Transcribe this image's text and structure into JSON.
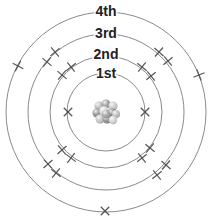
{
  "diagram": {
    "center": [
      106,
      112
    ],
    "shells": [
      {
        "label": "1st",
        "radius": 39,
        "label_y": 74
      },
      {
        "label": "2nd",
        "radius": 56,
        "label_y": 55
      },
      {
        "label": "3rd",
        "radius": 78,
        "label_y": 34
      },
      {
        "label": "4th",
        "radius": 100,
        "label_y": 12
      }
    ],
    "electrons": [
      {
        "shell": "1st",
        "x": 68,
        "y": 112,
        "style": "x"
      },
      {
        "shell": "1st",
        "x": 145,
        "y": 112,
        "style": "x"
      },
      {
        "shell": "2nd",
        "x": 62,
        "y": 75,
        "style": "plus"
      },
      {
        "shell": "2nd",
        "x": 71,
        "y": 67,
        "style": "plus"
      },
      {
        "shell": "2nd",
        "x": 142,
        "y": 67,
        "style": "plus"
      },
      {
        "shell": "2nd",
        "x": 151,
        "y": 76,
        "style": "plus"
      },
      {
        "shell": "2nd",
        "x": 62,
        "y": 150,
        "style": "plus"
      },
      {
        "shell": "2nd",
        "x": 71,
        "y": 158,
        "style": "plus"
      },
      {
        "shell": "2nd",
        "x": 150,
        "y": 148,
        "style": "plus"
      },
      {
        "shell": "2nd",
        "x": 142,
        "y": 158,
        "style": "plus"
      },
      {
        "shell": "3rd",
        "x": 47,
        "y": 62,
        "style": "plus"
      },
      {
        "shell": "3rd",
        "x": 55,
        "y": 52,
        "style": "plus"
      },
      {
        "shell": "3rd",
        "x": 159,
        "y": 52,
        "style": "plus"
      },
      {
        "shell": "3rd",
        "x": 168,
        "y": 61,
        "style": "plus"
      },
      {
        "shell": "3rd",
        "x": 48,
        "y": 164,
        "style": "plus"
      },
      {
        "shell": "3rd",
        "x": 56,
        "y": 173,
        "style": "plus"
      },
      {
        "shell": "3rd",
        "x": 166,
        "y": 165,
        "style": "plus"
      },
      {
        "shell": "3rd",
        "x": 157,
        "y": 175,
        "style": "plus"
      },
      {
        "shell": "4th",
        "x": 18,
        "y": 66,
        "style": "plus"
      },
      {
        "shell": "4th",
        "x": 199,
        "y": 75,
        "style": "plus"
      },
      {
        "shell": "4th",
        "x": 105,
        "y": 211,
        "style": "x"
      }
    ],
    "nucleus": {
      "x": 106,
      "y": 112,
      "particles": [
        {
          "dx": -7,
          "dy": -6,
          "r": 4.5,
          "color": "#b8b8b8"
        },
        {
          "dx": 0,
          "dy": -8,
          "r": 4.5,
          "color": "#9a9a9a"
        },
        {
          "dx": 7,
          "dy": -6,
          "r": 4.5,
          "color": "#c8c8c8"
        },
        {
          "dx": -9,
          "dy": 1,
          "r": 4.5,
          "color": "#8e8e8e"
        },
        {
          "dx": -2,
          "dy": -1,
          "r": 4.8,
          "color": "#d6d6d6"
        },
        {
          "dx": 6,
          "dy": 1,
          "r": 4.5,
          "color": "#7f7f7f"
        },
        {
          "dx": 10,
          "dy": 2,
          "r": 4,
          "color": "#bdbdbd"
        },
        {
          "dx": -6,
          "dy": 7,
          "r": 4.5,
          "color": "#c4c4c4"
        },
        {
          "dx": 1,
          "dy": 7,
          "r": 4.5,
          "color": "#909090"
        },
        {
          "dx": 7,
          "dy": 8,
          "r": 4.2,
          "color": "#d0d0d0"
        },
        {
          "dx": 0,
          "dy": 2,
          "r": 4.2,
          "color": "#a4a4a4"
        }
      ]
    }
  }
}
